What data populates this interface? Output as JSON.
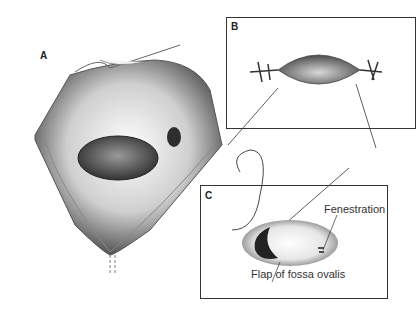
{
  "figure": {
    "panels": [
      {
        "id": "A",
        "label": "A",
        "description": "Opened right atrium showing fossa ovalis"
      },
      {
        "id": "B",
        "label": "B",
        "description": "Defect edges retracted with stay sutures"
      },
      {
        "id": "C",
        "label": "C",
        "description": "Patch sutured with fenestration"
      }
    ],
    "annotations": {
      "fenestration": "Fenestration",
      "flap": "Flap of fossa ovalis"
    }
  }
}
